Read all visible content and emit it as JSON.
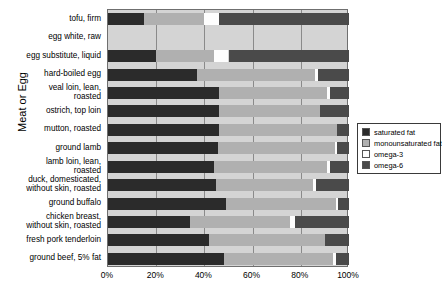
{
  "chart_data": {
    "type": "bar",
    "orientation": "horizontal",
    "stacked": true,
    "normalized": true,
    "title": "",
    "xlabel": "",
    "ylabel": "Meat or Egg",
    "xlim": [
      0,
      100
    ],
    "xticks": [
      0,
      20,
      40,
      60,
      80,
      100
    ],
    "xticklabels": [
      "0%",
      "20%",
      "40%",
      "60%",
      "80%",
      "100%"
    ],
    "grid": true,
    "legend_position": "right",
    "legend": [
      "saturated fat",
      "monounsaturated fat",
      "omega-3",
      "omega-6"
    ],
    "colors": {
      "saturated fat": "#2b2b2b",
      "monounsaturated fat": "#b0b0b0",
      "omega-3": "#fdfdfd",
      "omega-6": "#4a4a4a",
      "plot_background": "#d4d4d4",
      "gridline": "#8a8a8a",
      "frame": "#6f6f6f"
    },
    "categories": [
      "tofu, firm",
      "egg white, raw",
      "egg substitute, liquid",
      "hard-boiled egg",
      "veal loin, lean,\nroasted",
      "ostrich, top loin",
      "mutton, roasted",
      "ground lamb",
      "lamb loin, lean,\nroasted",
      "duck, domesticated,\nwithout skin, roasted",
      "ground buffalo",
      "chicken breast,\nwithout skin, roasted",
      "fresh pork tenderloin",
      "ground beef, 5% fat"
    ],
    "series": [
      {
        "name": "saturated fat",
        "values": [
          15.0,
          0.0,
          20.0,
          37.0,
          46.0,
          46.0,
          46.0,
          45.5,
          44.0,
          45.0,
          49.0,
          34.0,
          42.0,
          48.0
        ]
      },
      {
        "name": "monounsaturated fat",
        "values": [
          25.0,
          0.0,
          24.0,
          49.0,
          45.0,
          42.0,
          49.0,
          48.5,
          47.0,
          40.0,
          45.5,
          41.5,
          48.0,
          45.5
        ]
      },
      {
        "name": "omega-3",
        "values": [
          6.0,
          0.0,
          6.0,
          1.0,
          1.0,
          0.0,
          0.0,
          1.0,
          1.0,
          1.5,
          1.0,
          2.0,
          0.0,
          1.0
        ]
      },
      {
        "name": "omega-6",
        "values": [
          54.0,
          0.0,
          50.0,
          13.0,
          8.0,
          12.0,
          5.0,
          5.0,
          8.0,
          13.5,
          4.5,
          22.5,
          10.0,
          5.5
        ]
      }
    ]
  }
}
